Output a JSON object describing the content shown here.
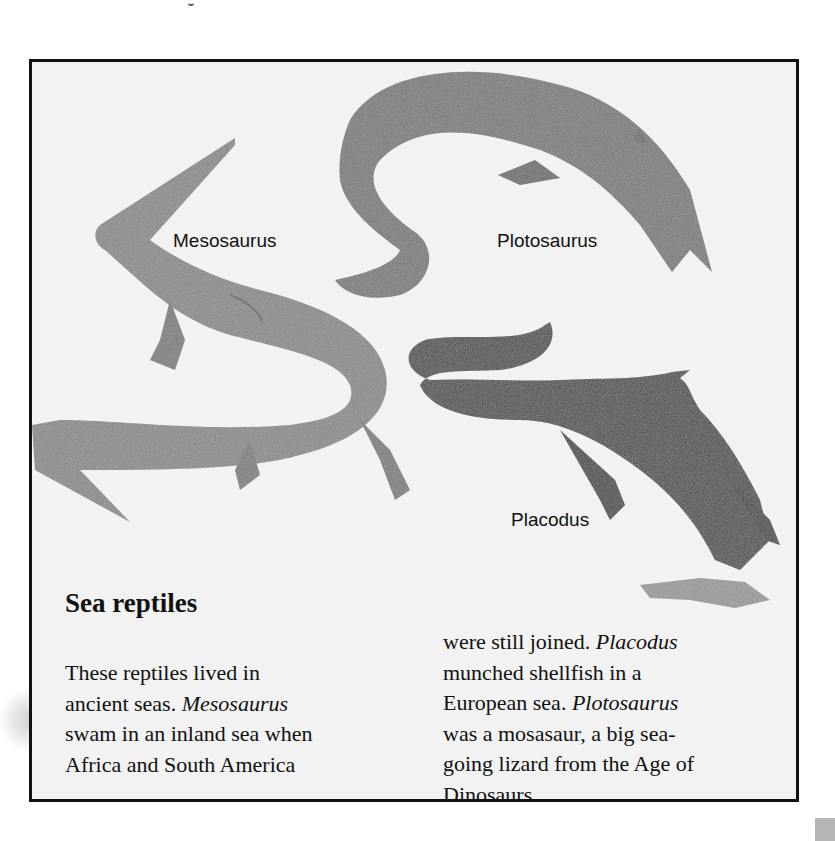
{
  "page": {
    "background": "#ffffff",
    "panel_background": "#f2f2f2",
    "panel_border": "#111111"
  },
  "illustration": {
    "labels": {
      "mesosaurus": "Mesosaurus",
      "plotosaurus": "Plotosaurus",
      "placodus": "Placodus"
    }
  },
  "article": {
    "heading": "Sea reptiles",
    "column1": {
      "line1": "These reptiles lived in",
      "line2_a": "ancient seas. ",
      "line2_b_italic": "Mesosaurus",
      "line3": "swam in an inland sea when",
      "line4": "Africa and South America"
    },
    "column2": {
      "line1_a": "were still joined. ",
      "line1_b_italic": "Placodus",
      "line2": "munched shellfish in a",
      "line3_a": "European sea. ",
      "line3_b_italic": "Plotosaurus",
      "line4": "was a mosasaur, a big sea-",
      "line5": "going lizard from the Age of",
      "line6": "Dinosaurs."
    }
  }
}
